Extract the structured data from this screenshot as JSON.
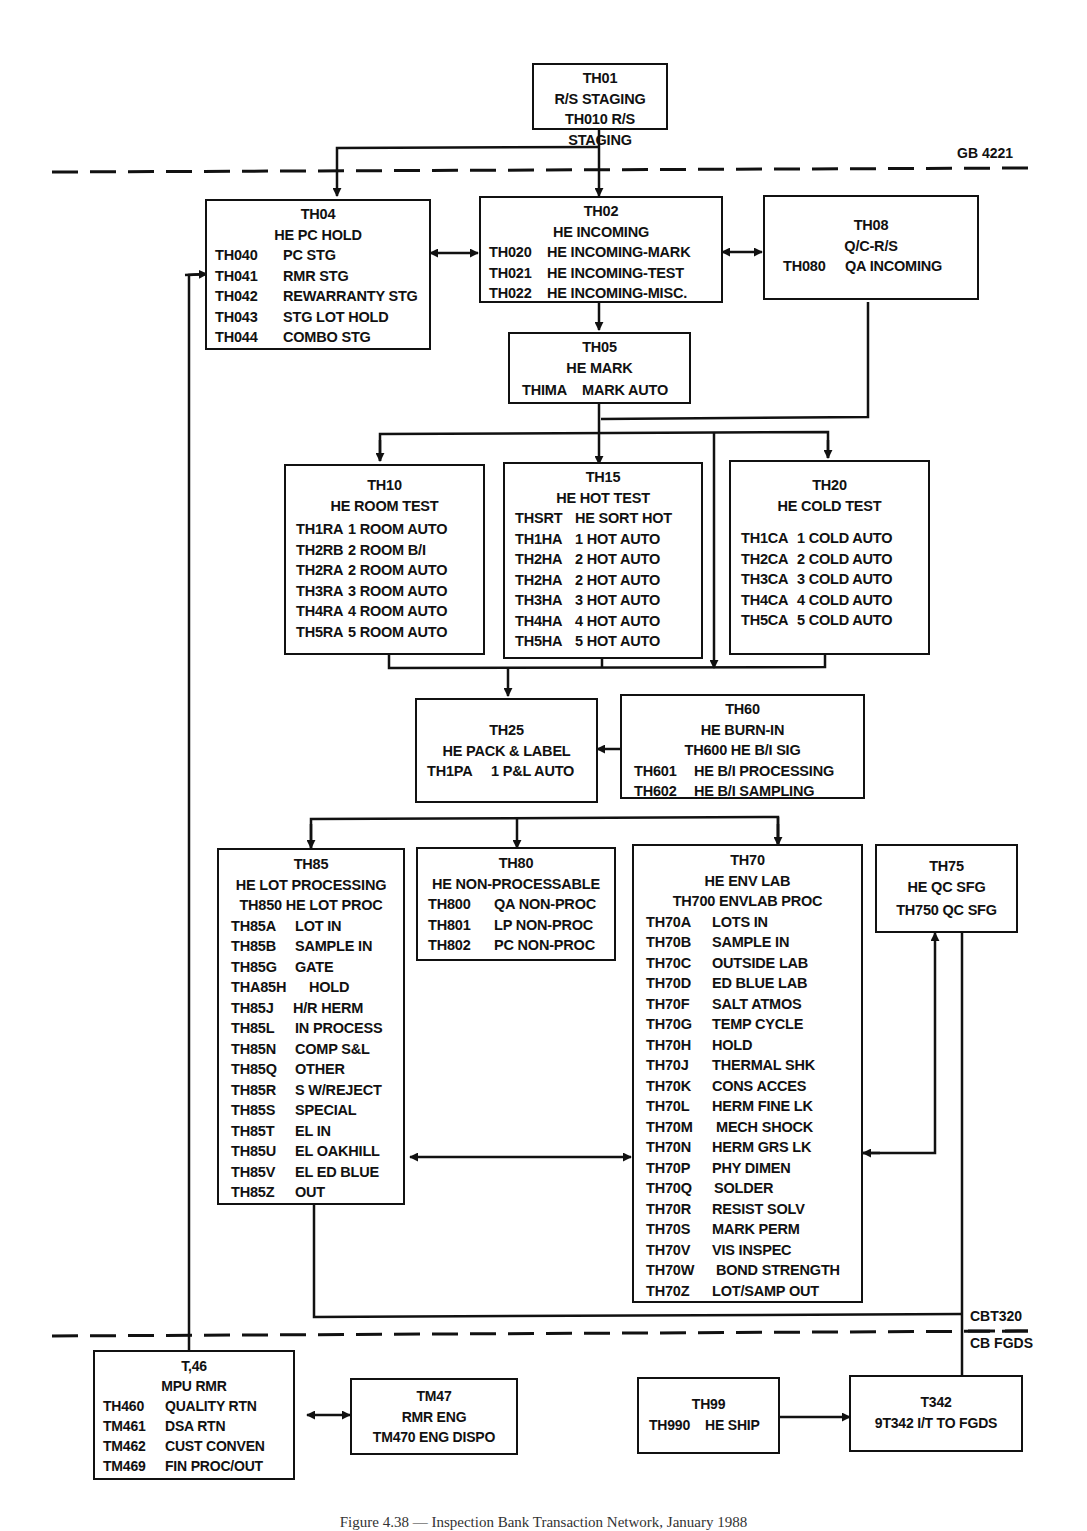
{
  "boundaries": {
    "top_label": "GB 4221",
    "bottom_label_upper": "CBT320",
    "bottom_label_lower": "CB FGDS"
  },
  "nodes": {
    "th01": {
      "id": "TH01",
      "title": "R/S STAGING",
      "sub": "TH010 R/S STAGING"
    },
    "th04": {
      "id": "TH04",
      "title": "HE PC HOLD",
      "rows": [
        {
          "code": "TH040",
          "label": "PC STG"
        },
        {
          "code": "TH041",
          "label": "RMR STG"
        },
        {
          "code": "TH042",
          "label": "REWARRANTY STG"
        },
        {
          "code": "TH043",
          "label": "STG LOT HOLD"
        },
        {
          "code": "TH044",
          "label": "COMBO STG"
        }
      ]
    },
    "th02": {
      "id": "TH02",
      "title": "HE INCOMING",
      "rows": [
        {
          "code": "TH020",
          "label": "HE INCOMING-MARK"
        },
        {
          "code": "TH021",
          "label": "HE INCOMING-TEST"
        },
        {
          "code": "TH022",
          "label": "HE INCOMING-MISC."
        }
      ]
    },
    "th08": {
      "id": "TH08",
      "title": "Q/C-R/S",
      "rows": [
        {
          "code": "TH080",
          "label": "QA INCOMING"
        }
      ]
    },
    "th05": {
      "id": "TH05",
      "title": "HE MARK",
      "rows": [
        {
          "code": "THIMA",
          "label": "MARK AUTO"
        }
      ]
    },
    "th10": {
      "id": "TH10",
      "title": "HE ROOM TEST",
      "rows": [
        {
          "code": "TH1RA",
          "label": "1 ROOM AUTO"
        },
        {
          "code": "TH2RB",
          "label": "2 ROOM B/I"
        },
        {
          "code": "TH2RA",
          "label": "2 ROOM AUTO"
        },
        {
          "code": "TH3RA",
          "label": "3 ROOM AUTO"
        },
        {
          "code": "TH4RA",
          "label": "4 ROOM AUTO"
        },
        {
          "code": "TH5RA",
          "label": "5 ROOM AUTO"
        }
      ]
    },
    "th15": {
      "id": "TH15",
      "title": "HE HOT TEST",
      "rows": [
        {
          "code": "THSRT",
          "label": "HE SORT HOT"
        },
        {
          "code": "TH1HA",
          "label": "1 HOT AUTO"
        },
        {
          "code": "TH2HA",
          "label": "2 HOT AUTO"
        },
        {
          "code": "TH2HA",
          "label": "2 HOT AUTO"
        },
        {
          "code": "TH3HA",
          "label": "3 HOT AUTO"
        },
        {
          "code": "TH4HA",
          "label": "4 HOT AUTO"
        },
        {
          "code": "TH5HA",
          "label": "5 HOT AUTO"
        }
      ]
    },
    "th20": {
      "id": "TH20",
      "title": "HE COLD TEST",
      "rows": [
        {
          "code": "TH1CA",
          "label": "1 COLD AUTO"
        },
        {
          "code": "TH2CA",
          "label": "2 COLD AUTO"
        },
        {
          "code": "TH3CA",
          "label": "3 COLD AUTO"
        },
        {
          "code": "TH4CA",
          "label": "4 COLD AUTO"
        },
        {
          "code": "TH5CA",
          "label": "5 COLD AUTO"
        }
      ]
    },
    "th25": {
      "id": "TH25",
      "title": "HE PACK & LABEL",
      "rows": [
        {
          "code": "TH1PA",
          "label": "1 P&L AUTO"
        }
      ]
    },
    "th60": {
      "id": "TH60",
      "title": "HE BURN-IN",
      "sub": "TH600 HE B/I SIG",
      "rows": [
        {
          "code": "TH601",
          "label": "HE B/I PROCESSING"
        },
        {
          "code": "TH602",
          "label": "HE B/I SAMPLING"
        }
      ]
    },
    "th85": {
      "id": "TH85",
      "title": "HE LOT PROCESSING",
      "sub": "TH850 HE LOT PROC",
      "rows": [
        {
          "code": "TH85A",
          "label": "LOT IN"
        },
        {
          "code": "TH85B",
          "label": "SAMPLE IN"
        },
        {
          "code": "TH85G",
          "label": "GATE"
        },
        {
          "code": "THA85H",
          "label": "HOLD"
        },
        {
          "code": "TH85J",
          "label": "H/R HERM"
        },
        {
          "code": "TH85L",
          "label": "IN PROCESS"
        },
        {
          "code": "TH85N",
          "label": "COMP S&L"
        },
        {
          "code": "TH85Q",
          "label": "OTHER"
        },
        {
          "code": "TH85R",
          "label": "S W/REJECT"
        },
        {
          "code": "TH85S",
          "label": "SPECIAL"
        },
        {
          "code": "TH85T",
          "label": "EL IN"
        },
        {
          "code": "TH85U",
          "label": "EL OAKHILL"
        },
        {
          "code": "TH85V",
          "label": "EL ED BLUE"
        },
        {
          "code": "TH85Z",
          "label": "OUT"
        }
      ]
    },
    "th80": {
      "id": "TH80",
      "title": "HE NON-PROCESSABLE",
      "rows": [
        {
          "code": "TH800",
          "label": "QA NON-PROC"
        },
        {
          "code": "TH801",
          "label": "LP NON-PROC"
        },
        {
          "code": "TH802",
          "label": "PC NON-PROC"
        }
      ]
    },
    "th70": {
      "id": "TH70",
      "title": "HE ENV LAB",
      "sub": "TH700 ENVLAB PROC",
      "rows": [
        {
          "code": "TH70A",
          "label": "LOTS IN"
        },
        {
          "code": "TH70B",
          "label": "SAMPLE IN"
        },
        {
          "code": "TH70C",
          "label": "OUTSIDE LAB"
        },
        {
          "code": "TH70D",
          "label": "ED BLUE LAB"
        },
        {
          "code": "TH70F",
          "label": "SALT ATMOS"
        },
        {
          "code": "TH70G",
          "label": "TEMP CYCLE"
        },
        {
          "code": "TH70H",
          "label": "HOLD"
        },
        {
          "code": "TH70J",
          "label": "THERMAL SHK"
        },
        {
          "code": "TH70K",
          "label": "CONS ACCES"
        },
        {
          "code": "TH70L",
          "label": "HERM FINE LK"
        },
        {
          "code": "TH70M",
          "label": "MECH SHOCK"
        },
        {
          "code": "TH70N",
          "label": "HERM GRS LK"
        },
        {
          "code": "TH70P",
          "label": "PHY DIMEN"
        },
        {
          "code": "TH70Q",
          "label": "SOLDER"
        },
        {
          "code": "TH70R",
          "label": "RESIST SOLV"
        },
        {
          "code": "TH70S",
          "label": "MARK PERM"
        },
        {
          "code": "TH70V",
          "label": "VIS INSPEC"
        },
        {
          "code": "TH70W",
          "label": "BOND STRENGTH"
        },
        {
          "code": "TH70Z",
          "label": "LOT/SAMP OUT"
        }
      ]
    },
    "th75": {
      "id": "TH75",
      "title": "HE QC SFG",
      "sub": "TH750 QC SFG"
    },
    "t46": {
      "id": "T,46",
      "title": "MPU RMR",
      "rows": [
        {
          "code": "TH460",
          "label": "QUALITY RTN"
        },
        {
          "code": "TM461",
          "label": "DSA RTN"
        },
        {
          "code": "TM462",
          "label": "CUST CONVEN"
        },
        {
          "code": "TM469",
          "label": "FIN PROC/OUT"
        }
      ]
    },
    "tm47": {
      "id": "TM47",
      "title": "RMR ENG",
      "sub": "TM470 ENG DISPO"
    },
    "th99": {
      "id": "TH99",
      "rows": [
        {
          "code": "TH990",
          "label": "HE SHIP"
        }
      ]
    },
    "t342": {
      "id": "T342",
      "title": "9T342 I/T TO FGDS"
    }
  },
  "caption": "Figure 4.38 — Inspection Bank Transaction Network, January 1988"
}
